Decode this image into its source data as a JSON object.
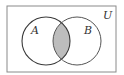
{
  "diagram": {
    "type": "venn",
    "universe_label": "U",
    "sets": [
      {
        "label": "A",
        "cx": 46,
        "cy": 41,
        "r": 24
      },
      {
        "label": "B",
        "cx": 77,
        "cy": 41,
        "r": 24
      }
    ],
    "shaded_region": "A ∩ B",
    "colors": {
      "stroke": "#3a3a3a",
      "shade": "#bdbdbd",
      "universe_stroke": "#8a8a8a"
    }
  }
}
